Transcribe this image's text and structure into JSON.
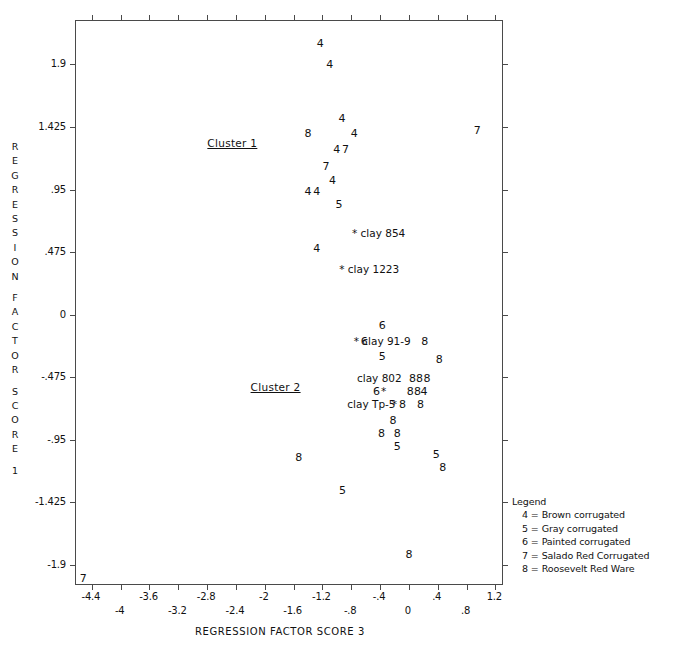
{
  "chart_data": {
    "type": "scatter",
    "title": "",
    "xlabel": "REGRESSION FACTOR SCORE 3",
    "ylabel": "REGRESSION FACTOR SCORE 1",
    "xlim": [
      -4.62,
      1.32
    ],
    "ylim": [
      -2.06,
      2.23
    ],
    "grid": false,
    "xticks": [
      {
        "value": -4.4,
        "label": "-4.4",
        "row": 0
      },
      {
        "value": -4.0,
        "label": "-4",
        "row": 1
      },
      {
        "value": -3.6,
        "label": "-3.6",
        "row": 0
      },
      {
        "value": -3.2,
        "label": "-3.2",
        "row": 1
      },
      {
        "value": -2.8,
        "label": "-2.8",
        "row": 0
      },
      {
        "value": -2.4,
        "label": "-2.4",
        "row": 1
      },
      {
        "value": -2.0,
        "label": "-2",
        "row": 0
      },
      {
        "value": -1.6,
        "label": "-1.6",
        "row": 1
      },
      {
        "value": -1.2,
        "label": "-1.2",
        "row": 0
      },
      {
        "value": -0.8,
        "label": "-.8",
        "row": 1
      },
      {
        "value": -0.4,
        "label": "-.4",
        "row": 0
      },
      {
        "value": 0.0,
        "label": "0",
        "row": 1
      },
      {
        "value": 0.4,
        "label": ".4",
        "row": 0
      },
      {
        "value": 0.8,
        "label": ".8",
        "row": 1
      },
      {
        "value": 1.2,
        "label": "1.2",
        "row": 0
      }
    ],
    "yticks": [
      {
        "value": 1.9,
        "label": "1.9"
      },
      {
        "value": 1.425,
        "label": "1.425"
      },
      {
        "value": 0.95,
        "label": ".95"
      },
      {
        "value": 0.475,
        "label": ".475"
      },
      {
        "value": 0.0,
        "label": "0"
      },
      {
        "value": -0.475,
        "label": "-.475"
      },
      {
        "value": -0.95,
        "label": "-.95"
      },
      {
        "value": -1.425,
        "label": "-1.425"
      },
      {
        "value": -1.9,
        "label": "-1.9"
      }
    ],
    "point_marker_is_text": true,
    "points": [
      {
        "x": -1.23,
        "y": 2.06,
        "label": "4"
      },
      {
        "x": -1.1,
        "y": 1.9,
        "label": "4"
      },
      {
        "x": -0.93,
        "y": 1.49,
        "label": "4"
      },
      {
        "x": -1.4,
        "y": 1.38,
        "label": "8"
      },
      {
        "x": -0.76,
        "y": 1.38,
        "label": "4"
      },
      {
        "x": 0.95,
        "y": 1.4,
        "label": "7"
      },
      {
        "x": -1.0,
        "y": 1.26,
        "label": "4"
      },
      {
        "x": -0.88,
        "y": 1.26,
        "label": "7"
      },
      {
        "x": -1.15,
        "y": 1.13,
        "label": "7"
      },
      {
        "x": -1.06,
        "y": 1.02,
        "label": "4"
      },
      {
        "x": -1.4,
        "y": 0.94,
        "label": "4"
      },
      {
        "x": -1.28,
        "y": 0.94,
        "label": "4"
      },
      {
        "x": -0.97,
        "y": 0.84,
        "label": "5"
      },
      {
        "x": -1.28,
        "y": 0.51,
        "label": "4"
      },
      {
        "x": -0.42,
        "y": 0.62,
        "label": "* clay 854",
        "kind": "clay"
      },
      {
        "x": -0.55,
        "y": 0.35,
        "label": "* clay 1223",
        "kind": "clay"
      },
      {
        "x": -0.37,
        "y": -0.08,
        "label": "6"
      },
      {
        "x": -0.62,
        "y": -0.2,
        "label": "6"
      },
      {
        "x": -0.37,
        "y": -0.2,
        "label": "* clay 91-9",
        "kind": "clay"
      },
      {
        "x": 0.22,
        "y": -0.2,
        "label": "8"
      },
      {
        "x": -0.37,
        "y": -0.31,
        "label": "5"
      },
      {
        "x": 0.42,
        "y": -0.34,
        "label": "8"
      },
      {
        "x": -0.41,
        "y": -0.48,
        "label": "clay 802",
        "kind": "clay"
      },
      {
        "x": 0.1,
        "y": -0.48,
        "label": "88"
      },
      {
        "x": 0.25,
        "y": -0.48,
        "label": "8"
      },
      {
        "x": -0.45,
        "y": -0.58,
        "label": "6"
      },
      {
        "x": -0.35,
        "y": -0.58,
        "label": "*",
        "kind": "clay"
      },
      {
        "x": 0.02,
        "y": -0.58,
        "label": "8"
      },
      {
        "x": 0.12,
        "y": -0.58,
        "label": "8"
      },
      {
        "x": 0.21,
        "y": -0.58,
        "label": "4"
      },
      {
        "x": -0.52,
        "y": -0.68,
        "label": "clay Tp-5",
        "kind": "clay"
      },
      {
        "x": -0.2,
        "y": -0.68,
        "label": "*",
        "kind": "clay"
      },
      {
        "x": -0.09,
        "y": -0.68,
        "label": "8"
      },
      {
        "x": 0.16,
        "y": -0.68,
        "label": "8"
      },
      {
        "x": -0.22,
        "y": -0.8,
        "label": "8"
      },
      {
        "x": -0.38,
        "y": -0.9,
        "label": "8"
      },
      {
        "x": -0.16,
        "y": -0.9,
        "label": "8"
      },
      {
        "x": -0.16,
        "y": -1.0,
        "label": "5"
      },
      {
        "x": -1.53,
        "y": -1.08,
        "label": "8"
      },
      {
        "x": 0.38,
        "y": -1.06,
        "label": "5"
      },
      {
        "x": 0.47,
        "y": -1.16,
        "label": "8"
      },
      {
        "x": -0.92,
        "y": -1.33,
        "label": "5"
      },
      {
        "x": 0.0,
        "y": -1.82,
        "label": "8"
      },
      {
        "x": -4.52,
        "y": -2.0,
        "label": "7"
      }
    ],
    "annotations": [
      {
        "x": -2.45,
        "y": 1.3,
        "text": "Cluster 1"
      },
      {
        "x": -1.85,
        "y": -0.55,
        "text": "Cluster 2"
      }
    ]
  },
  "y_axis_title_chars": [
    "R",
    "E",
    "G",
    "R",
    "E",
    "S",
    "S",
    "I",
    "O",
    "N",
    "",
    "F",
    "A",
    "C",
    "T",
    "O",
    "R",
    "",
    "S",
    "C",
    "O",
    "R",
    "E",
    "",
    "1"
  ],
  "legend": {
    "title": "Legend",
    "items": [
      "4 = Brown corrugated",
      "5 = Gray corrugated",
      "6 = Painted corrugated",
      "7 = Salado Red Corrugated",
      "8 = Roosevelt Red Ware"
    ]
  }
}
